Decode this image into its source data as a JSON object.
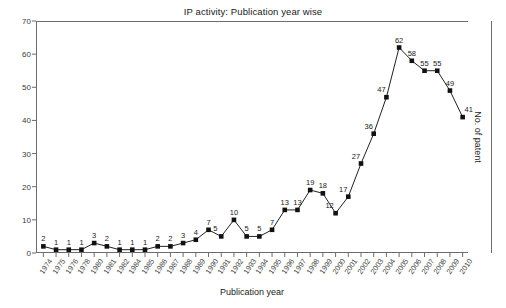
{
  "chart_data": {
    "type": "line",
    "title": "IP activity: Publication year wise",
    "xlabel": "Publication year",
    "ylabel": "No. of patent",
    "ylim": [
      0,
      70
    ],
    "ytick_step": 10,
    "yticks": [
      0,
      10,
      20,
      30,
      40,
      50,
      60,
      70
    ],
    "grid": false,
    "legend": "none",
    "marker": "square",
    "marker_color": "#111111",
    "line_color": "#222222",
    "show_point_labels": true,
    "categories": [
      "1974",
      "1975",
      "1976",
      "1978",
      "1980",
      "1981",
      "1982",
      "1984",
      "1985",
      "1986",
      "1987",
      "1988",
      "1989",
      "1990",
      "1991",
      "1992",
      "1993",
      "1994",
      "1995",
      "1996",
      "1997",
      "1998",
      "1999",
      "2000",
      "2001",
      "2002",
      "2003",
      "2004",
      "2005",
      "2006",
      "2007",
      "2008",
      "2009",
      "2010"
    ],
    "values": [
      2,
      1,
      1,
      1,
      3,
      2,
      1,
      1,
      1,
      2,
      2,
      3,
      4,
      7,
      5,
      10,
      5,
      5,
      7,
      13,
      13,
      19,
      18,
      12,
      17,
      27,
      36,
      47,
      62,
      58,
      55,
      55,
      49,
      41
    ],
    "series": [
      {
        "name": "No. of patent",
        "values": [
          2,
          1,
          1,
          1,
          3,
          2,
          1,
          1,
          1,
          2,
          2,
          3,
          4,
          7,
          5,
          10,
          5,
          5,
          7,
          13,
          13,
          19,
          18,
          12,
          17,
          27,
          36,
          47,
          62,
          58,
          55,
          55,
          49,
          41
        ]
      }
    ]
  }
}
